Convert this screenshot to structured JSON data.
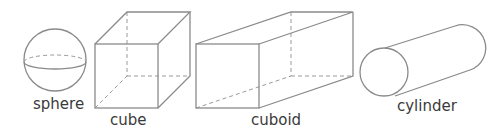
{
  "shapes": [
    {
      "id": "sphere",
      "label": "sphere"
    },
    {
      "id": "cube",
      "label": "cube"
    },
    {
      "id": "cuboid",
      "label": "cuboid"
    },
    {
      "id": "cylinder",
      "label": "cylinder"
    }
  ],
  "colors": {
    "line": "#8a8a8a",
    "dashed": "#9a9a9a",
    "text": "#3a3a3a"
  }
}
